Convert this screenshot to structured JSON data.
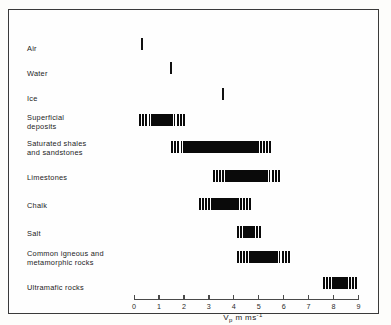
{
  "figure": {
    "background_color": "#fdfdfb",
    "frame_color": "#3a3a3a",
    "bar_color": "#0a0a0a",
    "axis_color": "#4a4a4a"
  },
  "axis": {
    "title_symbol": "V",
    "title_subscript": "p",
    "title_unit": " m ms",
    "title_superscript": "-1",
    "min": 0,
    "max": 9,
    "ticks": [
      {
        "value": 0,
        "label": "0"
      },
      {
        "value": 1,
        "label": "1"
      },
      {
        "value": 2,
        "label": "2"
      },
      {
        "value": 3,
        "label": "3"
      },
      {
        "value": 4,
        "label": "4"
      },
      {
        "value": 5,
        "label": "5"
      },
      {
        "value": 6,
        "label": "6"
      },
      {
        "value": 7,
        "label": "7"
      },
      {
        "value": 8,
        "label": "8"
      },
      {
        "value": 9,
        "label": "9"
      }
    ]
  },
  "chart_data": {
    "type": "bar",
    "orientation": "horizontal",
    "title": "",
    "xlabel": "Vp m ms-1",
    "ylabel": "",
    "xlim": [
      0,
      9
    ],
    "grid": false,
    "legend": false,
    "note": "Ranges of P-wave velocity for earth materials; each bar spans a min-max interval",
    "categories": [
      "Air",
      "Water",
      "Ice",
      "Superficial deposits",
      "Saturated shales and sandstones",
      "Limestones",
      "Chalk",
      "Salt",
      "Common igneous and metamorphic rocks",
      "Ultramafic rocks"
    ],
    "ranges": [
      {
        "label": "Air",
        "min": 0.3,
        "max": 0.35
      },
      {
        "label": "Water",
        "min": 1.45,
        "max": 1.5
      },
      {
        "label": "Ice",
        "min": 3.55,
        "max": 3.6
      },
      {
        "label": "Superficial deposits",
        "min": 0.2,
        "max": 2.1
      },
      {
        "label": "Saturated shales and sandstones",
        "min": 1.45,
        "max": 5.55
      },
      {
        "label": "Limestones",
        "min": 3.15,
        "max": 5.9
      },
      {
        "label": "Chalk",
        "min": 2.6,
        "max": 4.75
      },
      {
        "label": "Salt",
        "min": 4.1,
        "max": 5.15
      },
      {
        "label": "Common igneous and metamorphic rocks",
        "min": 4.1,
        "max": 6.3
      },
      {
        "label": "Ultramafic rocks",
        "min": 7.55,
        "max": 9.0
      }
    ]
  },
  "rows": [
    {
      "label": "Air",
      "label_y": 44,
      "bar_y": 38,
      "min": 0.3,
      "max": 0.35,
      "thin": true,
      "hatch": false
    },
    {
      "label": "Water",
      "label_y": 69,
      "bar_y": 62,
      "min": 1.45,
      "max": 1.5,
      "thin": true,
      "hatch": false
    },
    {
      "label": "Ice",
      "label_y": 94,
      "bar_y": 88,
      "min": 3.55,
      "max": 3.6,
      "thin": true,
      "hatch": false
    },
    {
      "label": "Superficial\ndeposits",
      "label_y": 113,
      "bar_y": 114,
      "min": 0.2,
      "max": 2.1,
      "thin": false,
      "hatch": true
    },
    {
      "label": "Saturated shales\nand sandstones",
      "label_y": 139,
      "bar_y": 141,
      "min": 1.45,
      "max": 5.55,
      "thin": false,
      "hatch": true
    },
    {
      "label": "Limestones",
      "label_y": 173,
      "bar_y": 170,
      "min": 3.15,
      "max": 5.9,
      "thin": false,
      "hatch": true
    },
    {
      "label": "Chalk",
      "label_y": 201,
      "bar_y": 198,
      "min": 2.6,
      "max": 4.75,
      "thin": false,
      "hatch": true
    },
    {
      "label": "Salt",
      "label_y": 229,
      "bar_y": 226,
      "min": 4.1,
      "max": 5.15,
      "thin": false,
      "hatch": true
    },
    {
      "label": "Common  igneous and\nmetamorphic rocks",
      "label_y": 249,
      "bar_y": 251,
      "min": 4.1,
      "max": 6.3,
      "thin": false,
      "hatch": true
    },
    {
      "label": "Ultramafic rocks",
      "label_y": 283,
      "bar_y": 277,
      "min": 7.55,
      "max": 9.0,
      "thin": false,
      "hatch": true
    }
  ]
}
